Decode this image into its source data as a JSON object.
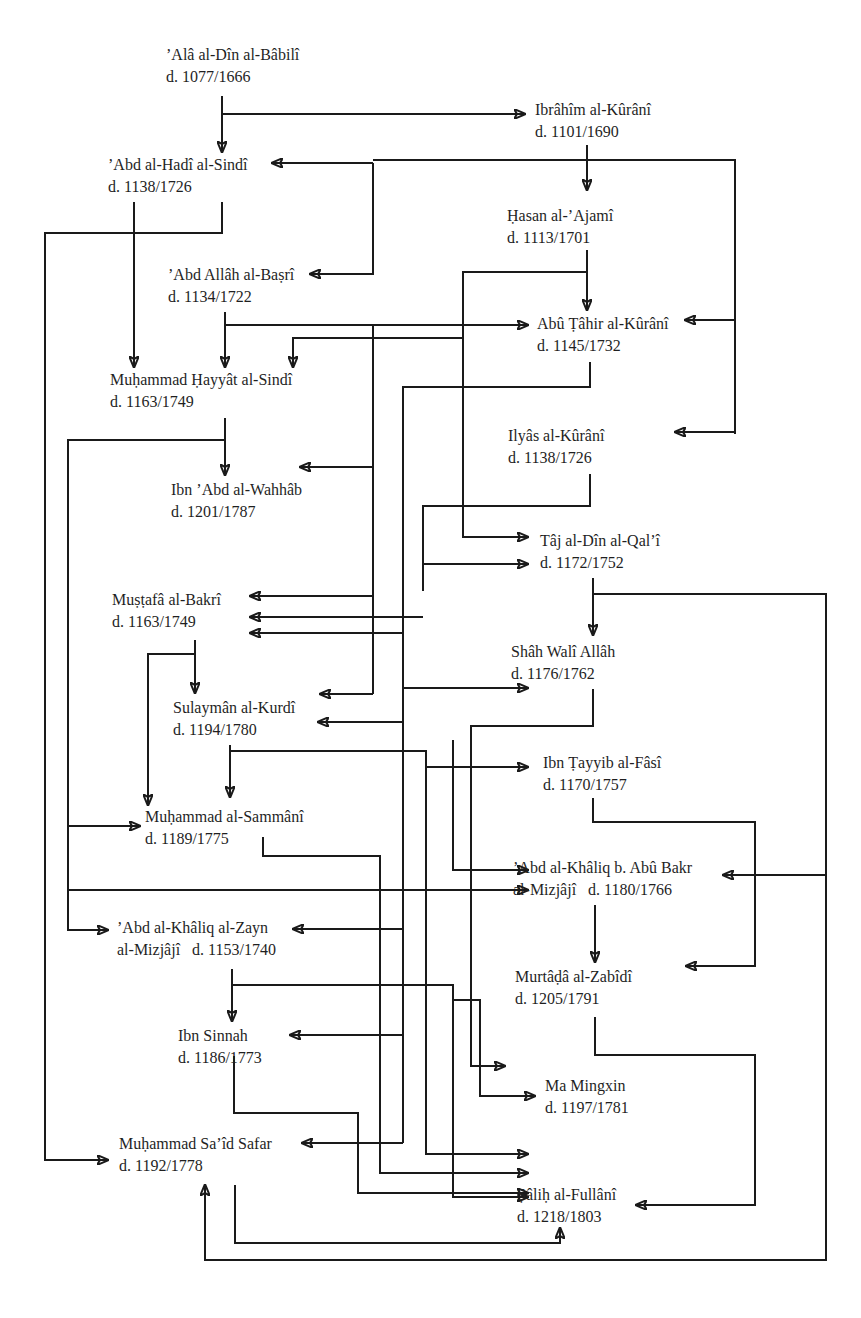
{
  "diagram": {
    "type": "scholarly-transmission-network",
    "nodes": [
      {
        "id": "babili",
        "name": "’Alâ al-Dîn al-Bâbilî",
        "dates": "d. 1077/1666"
      },
      {
        "id": "ibrahim_kurani",
        "name": "Ibrâhîm al-Kûrânî",
        "dates": "d. 1101/1690"
      },
      {
        "id": "abd_hadi_sindi",
        "name": "’Abd al-Hadî al-Sindî",
        "dates": "d. 1138/1726"
      },
      {
        "id": "hasan_ajami",
        "name": "Ḥasan al-’Ajamî",
        "dates": "d. 1113/1701"
      },
      {
        "id": "abd_allah_basri",
        "name": "’Abd Allâh al-Baṣrî",
        "dates": "d. 1134/1722"
      },
      {
        "id": "abu_tahir_kurani",
        "name": "Abû Ṭâhir al-Kûrânî",
        "dates": "d. 1145/1732"
      },
      {
        "id": "hayyat_sindi",
        "name": "Muḥammad Ḥayyât al-Sindî",
        "dates": "d. 1163/1749"
      },
      {
        "id": "ilyas_kurani",
        "name": "Ilyâs al-Kûrânî",
        "dates": "d. 1138/1726"
      },
      {
        "id": "ibn_abd_wahhab",
        "name": "Ibn ’Abd al-Wahhâb",
        "dates": "d. 1201/1787"
      },
      {
        "id": "taj_qali",
        "name": "Tâj al-Dîn al-Qal’î",
        "dates": "d. 1172/1752"
      },
      {
        "id": "mustafa_bakri",
        "name": "Muṣṭafâ al-Bakrî",
        "dates": "d. 1163/1749"
      },
      {
        "id": "shah_wali_allah",
        "name": "Shâh Walî Allâh",
        "dates": "d. 1176/1762"
      },
      {
        "id": "sulayman_kurdi",
        "name": "Sulaymân al-Kurdî",
        "dates": "d. 1194/1780"
      },
      {
        "id": "ibn_tayyib_fasi",
        "name": "Ibn Ṭayyib al-Fâsî",
        "dates": "d. 1170/1757"
      },
      {
        "id": "sammani",
        "name": "Muḥammad al-Sammânî",
        "dates": "d. 1189/1775"
      },
      {
        "id": "khaliq_abu_bakr",
        "name": "’Abd al-Khâliq b. Abû Bakr",
        "name2": "al-Mizjâjî",
        "dates": "d. 1180/1766"
      },
      {
        "id": "khaliq_zayn",
        "name": "’Abd al-Khâliq al-Zayn",
        "name2": "al-Mizjâjî",
        "dates": "d. 1153/1740"
      },
      {
        "id": "murtada_zabidi",
        "name": "Murtâḍâ al-Zabîdî",
        "dates": "d. 1205/1791"
      },
      {
        "id": "ibn_sinnah",
        "name": "Ibn Sinnah",
        "dates": "d. 1186/1773"
      },
      {
        "id": "ma_mingxin",
        "name": "Ma Mingxin",
        "dates": "d. 1197/1781"
      },
      {
        "id": "said_safar",
        "name": "Muḥammad Sa’îd Safar",
        "dates": "d. 1192/1778"
      },
      {
        "id": "salih_fullani",
        "name": "Ṣâliḥ al-Fullânî",
        "dates": "d. 1218/1803"
      }
    ],
    "edges": [
      {
        "from": "babili",
        "to": "abd_hadi_sindi"
      },
      {
        "from": "babili",
        "to": "ibrahim_kurani"
      },
      {
        "from": "ibrahim_kurani",
        "to": "hasan_ajami"
      },
      {
        "from": "ibrahim_kurani",
        "to": "abd_hadi_sindi"
      },
      {
        "from": "ibrahim_kurani",
        "to": "abd_allah_basri"
      },
      {
        "from": "ibrahim_kurani",
        "to": "abu_tahir_kurani"
      },
      {
        "from": "ibrahim_kurani",
        "to": "ilyas_kurani"
      },
      {
        "from": "abd_hadi_sindi",
        "to": "hayyat_sindi"
      },
      {
        "from": "abd_hadi_sindi",
        "to": "said_safar"
      },
      {
        "from": "hasan_ajami",
        "to": "abu_tahir_kurani"
      },
      {
        "from": "hasan_ajami",
        "to": "taj_qali"
      },
      {
        "from": "abd_allah_basri",
        "to": "hayyat_sindi"
      },
      {
        "from": "abd_allah_basri",
        "to": "abu_tahir_kurani"
      },
      {
        "from": "abd_allah_basri",
        "to": "ibn_abd_wahhab"
      },
      {
        "from": "abd_allah_basri",
        "to": "mustafa_bakri"
      },
      {
        "from": "abd_allah_basri",
        "to": "sulayman_kurdi"
      },
      {
        "from": "abu_tahir_kurani",
        "to": "hayyat_sindi"
      },
      {
        "from": "abu_tahir_kurani",
        "to": "shah_wali_allah"
      },
      {
        "from": "abu_tahir_kurani",
        "to": "sulayman_kurdi"
      },
      {
        "from": "abu_tahir_kurani",
        "to": "khaliq_zayn"
      },
      {
        "from": "abu_tahir_kurani",
        "to": "ibn_sinnah"
      },
      {
        "from": "abu_tahir_kurani",
        "to": "said_safar"
      },
      {
        "from": "hayyat_sindi",
        "to": "ibn_abd_wahhab"
      },
      {
        "from": "hayyat_sindi",
        "to": "sammani"
      },
      {
        "from": "hayyat_sindi",
        "to": "khaliq_abu_bakr"
      },
      {
        "from": "hayyat_sindi",
        "to": "khaliq_zayn"
      },
      {
        "from": "ilyas_kurani",
        "to": "taj_qali"
      },
      {
        "from": "ilyas_kurani",
        "to": "mustafa_bakri"
      },
      {
        "from": "taj_qali",
        "to": "shah_wali_allah"
      },
      {
        "from": "taj_qali",
        "to": "khaliq_abu_bakr"
      },
      {
        "from": "mustafa_bakri",
        "to": "sulayman_kurdi"
      },
      {
        "from": "mustafa_bakri",
        "to": "sammani"
      },
      {
        "from": "shah_wali_allah",
        "to": "murtada_zabidi"
      },
      {
        "from": "sulayman_kurdi",
        "to": "sammani"
      },
      {
        "from": "sulayman_kurdi",
        "to": "ibn_tayyib_fasi"
      },
      {
        "from": "sulayman_kurdi",
        "to": "salih_fullani"
      },
      {
        "from": "ibn_tayyib_fasi",
        "to": "murtada_zabidi"
      },
      {
        "from": "sammani",
        "to": "salih_fullani"
      },
      {
        "from": "khaliq_abu_bakr",
        "to": "murtada_zabidi"
      },
      {
        "from": "khaliq_zayn",
        "to": "ibn_sinnah"
      },
      {
        "from": "khaliq_zayn",
        "to": "ma_mingxin"
      },
      {
        "from": "khaliq_zayn",
        "to": "salih_fullani"
      },
      {
        "from": "murtada_zabidi",
        "to": "salih_fullani"
      },
      {
        "from": "ibn_sinnah",
        "to": "salih_fullani"
      },
      {
        "from": "said_safar",
        "to": "salih_fullani"
      },
      {
        "from": "salih_fullani",
        "to": "said_safar"
      }
    ]
  }
}
